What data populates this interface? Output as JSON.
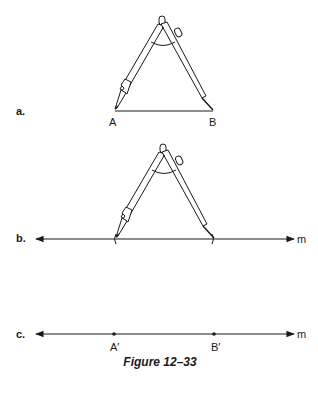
{
  "figure": {
    "caption": "Figure 12–33",
    "parts": {
      "a": {
        "label": "a.",
        "point_left": "A",
        "point_right": "B"
      },
      "b": {
        "label": "b.",
        "line_name": "m"
      },
      "c": {
        "label": "c.",
        "line_name": "m",
        "point_left": "A′",
        "point_right": "B′"
      }
    }
  },
  "colors": {
    "ink": "#1a1a1a",
    "background": "#ffffff"
  }
}
